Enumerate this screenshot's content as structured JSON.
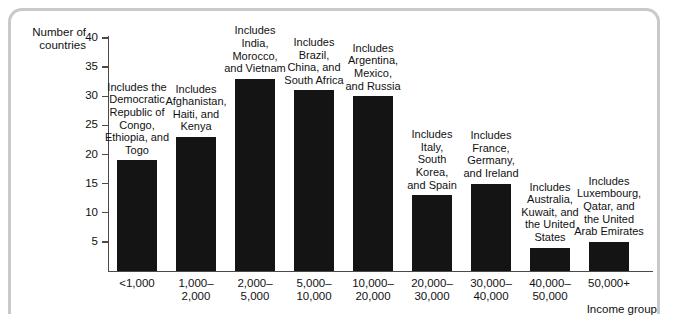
{
  "chart_data": {
    "type": "bar",
    "title": "",
    "ylabel": "Number of\ncountries",
    "xlabel": "Income group",
    "ylim": [
      0,
      40
    ],
    "ytick_values": [
      5,
      10,
      15,
      20,
      25,
      30,
      35,
      40
    ],
    "grid": false,
    "legend": "none",
    "bar_color": "#141414",
    "categories": [
      "<1,000",
      "1,000–\n2,000",
      "2,000–\n5,000",
      "5,000–\n10,000",
      "10,000–\n20,000",
      "20,000–\n30,000",
      "30,000–\n40,000",
      "40,000–\n50,000",
      "50,000+"
    ],
    "values": [
      19,
      23,
      33,
      31,
      30,
      13,
      15,
      4,
      5
    ],
    "annotations": [
      "Includes the\nDemocratic\nRepublic of\nCongo,\nEthiopia, and\nTogo",
      "Includes\nAfghanistan,\nHaiti, and\nKenya",
      "Includes\nIndia,\nMorocco,\nand Vietnam",
      "Includes\nBrazil,\nChina, and\nSouth Africa",
      "Includes\nArgentina,\nMexico,\nand Russia",
      "Includes\nItaly,\nSouth\nKorea,\nand Spain",
      "Includes\nFrance,\nGermany,\nand Ireland",
      "Includes\nAustralia,\nKuwait, and\nthe United\nStates",
      "Includes\nLuxembourg,\nQatar, and\nthe United\nArab Emirates"
    ]
  }
}
